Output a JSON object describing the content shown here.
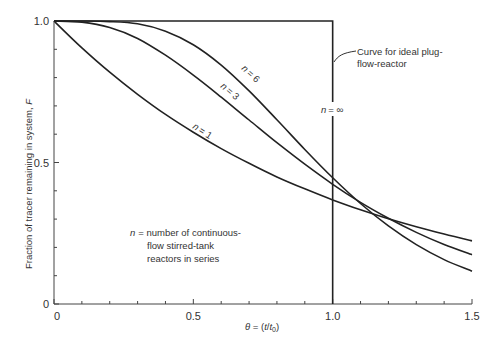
{
  "chart_data": {
    "type": "line",
    "title": "",
    "xlabel": "θ = (t/t0)",
    "xlabel_parts": {
      "prefix": "θ = (",
      "t": "t",
      "slash": "/",
      "t0": "t",
      "sub": "0",
      "suffix": ")"
    },
    "ylabel": "Fraction of tracer remaining in system, F",
    "ylabel_parts": {
      "text": "Fraction of tracer remaining in system, ",
      "var": "F"
    },
    "xlim": [
      0,
      1.5
    ],
    "ylim": [
      0,
      1.0
    ],
    "grid": false,
    "x_ticks": [
      0,
      0.5,
      1.0,
      1.5
    ],
    "x_tick_labels": [
      "0",
      "0.5",
      "1.0",
      "1.5"
    ],
    "x_minor_step": 0.1,
    "y_ticks": [
      0,
      0.5,
      1.0
    ],
    "y_tick_labels": [
      "0",
      "0.5",
      "1.0"
    ],
    "y_minor_step": 0.1,
    "x": [
      0,
      0.1,
      0.2,
      0.3,
      0.4,
      0.5,
      0.6,
      0.7,
      0.8,
      0.9,
      1.0,
      1.1,
      1.2,
      1.3,
      1.4,
      1.5
    ],
    "series": [
      {
        "name": "n = 1",
        "label_n": "n",
        "label_val": "= 1",
        "values": [
          1.0,
          0.905,
          0.819,
          0.741,
          0.67,
          0.607,
          0.549,
          0.497,
          0.449,
          0.407,
          0.368,
          0.333,
          0.301,
          0.273,
          0.247,
          0.223
        ]
      },
      {
        "name": "n = 3",
        "label_n": "n",
        "label_val": "= 3",
        "values": [
          1.0,
          0.996,
          0.977,
          0.938,
          0.879,
          0.809,
          0.731,
          0.65,
          0.57,
          0.494,
          0.423,
          0.359,
          0.303,
          0.253,
          0.21,
          0.174
        ]
      },
      {
        "name": "n = 6",
        "label_n": "n",
        "label_val": "= 6",
        "values": [
          1.0,
          1.0,
          0.998,
          0.99,
          0.964,
          0.916,
          0.844,
          0.753,
          0.651,
          0.546,
          0.446,
          0.355,
          0.276,
          0.21,
          0.157,
          0.116
        ]
      },
      {
        "name": "n = ∞",
        "label_n": "n",
        "label_val": "= ∞",
        "step": {
          "x": 1.0,
          "before": 1.0,
          "after": 0.0
        }
      }
    ],
    "annotations": [
      {
        "text_lines": [
          "Curve for ideal plug-",
          "flow-reactor"
        ],
        "points_to": "n = ∞"
      },
      {
        "text_lines": [
          "= number of continuous-",
          "flow stirred-tank",
          "reactors in series"
        ],
        "var": "n"
      }
    ],
    "legend": "none (inline curve labels)"
  }
}
